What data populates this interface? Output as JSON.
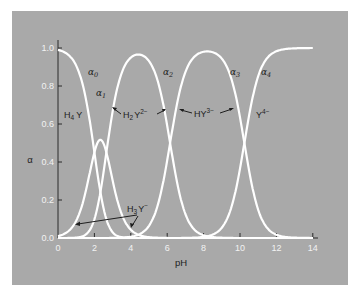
{
  "chart_data": {
    "type": "line",
    "title": "",
    "xlabel": "pH",
    "ylabel": "α",
    "xlim": [
      0,
      14.5
    ],
    "ylim": [
      0,
      1.0
    ],
    "grid": false,
    "legend": "none (inline labels)",
    "x_ticks": [
      "0",
      "2",
      "4",
      "6",
      "8",
      "10",
      "12",
      "14"
    ],
    "y_ticks": [
      "0.0",
      "0.2",
      "0.4",
      "0.6",
      "0.8",
      "1.0"
    ],
    "pKa": [
      2.0,
      2.66,
      6.16,
      10.24
    ],
    "series": [
      {
        "name": "α0",
        "species": "H4Y",
        "peak_pH": 0.0,
        "peak_alpha": 1.0
      },
      {
        "name": "α1",
        "species": "H3Y-",
        "peak_pH": 2.3,
        "peak_alpha": 0.72
      },
      {
        "name": "α2",
        "species": "H2Y2-",
        "peak_pH": 4.4,
        "peak_alpha": 0.97
      },
      {
        "name": "α3",
        "species": "HY3-",
        "peak_pH": 8.2,
        "peak_alpha": 0.98
      },
      {
        "name": "α4",
        "species": "Y4-",
        "peak_pH": 14.0,
        "peak_alpha": 1.0
      }
    ],
    "annotations": [
      {
        "text": "α0",
        "x": 1.5,
        "y": 0.87
      },
      {
        "text": "α1",
        "x": 2.3,
        "y": 0.77
      },
      {
        "text": "α2",
        "x": 6.0,
        "y": 0.97
      },
      {
        "text": "α3",
        "x": 9.6,
        "y": 0.97
      },
      {
        "text": "α4",
        "x": 11.4,
        "y": 0.97
      },
      {
        "text": "H4Y",
        "x": 0.9,
        "y": 0.66
      },
      {
        "text": "H2Y2-",
        "x": 4.6,
        "y": 0.66
      },
      {
        "text": "HY3-",
        "x": 8.2,
        "y": 0.66
      },
      {
        "text": "Y4-",
        "x": 11.3,
        "y": 0.66
      },
      {
        "text": "H3Y-",
        "x": 4.6,
        "y": 0.24
      }
    ]
  },
  "labels": {
    "xlabel": "pH",
    "ylabel": "α",
    "alpha0": "α",
    "alpha1": "α",
    "alpha2": "α",
    "alpha3": "α",
    "alpha4": "α",
    "sub0": "0",
    "sub1": "1",
    "sub2": "2",
    "sub3": "3",
    "sub4": "4",
    "h4y_main": "H",
    "h4y_sub": "4",
    "h4y_tail": "Y",
    "h2y_h": "H",
    "h2y_sub": "2",
    "h2y_y": "Y",
    "h2y_sup": "2−",
    "hy_main": "HY",
    "hy_sup": "3−",
    "y_main": "Y",
    "y_sup": "4−",
    "h3y_h": "H",
    "h3y_sub": "3",
    "h3y_y": "Y",
    "h3y_sup": "−"
  },
  "colors": {
    "panel": "#a9a9a9",
    "curve": "#ffffff",
    "axis": "#2a2a2a",
    "tick_label": "#f2f2f2",
    "text": "#1e1e1e"
  }
}
